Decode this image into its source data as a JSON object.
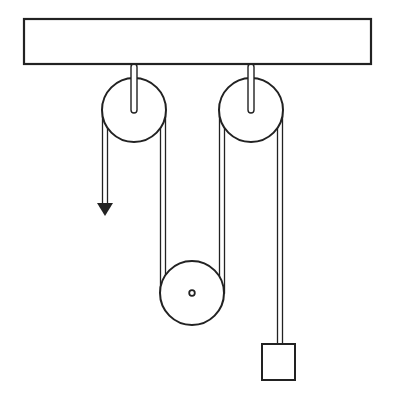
{
  "diagram": {
    "type": "pulley-system",
    "colors": {
      "stroke": "#222222",
      "fill": "#ffffff",
      "background": "#ffffff"
    },
    "beam": {
      "x": 24,
      "y": 19,
      "width": 347,
      "height": 45
    },
    "fixed_pulleys": [
      {
        "id": "left",
        "cx": 134,
        "cy": 110,
        "r": 32,
        "rod_top": 64
      },
      {
        "id": "right",
        "cx": 251,
        "cy": 110,
        "r": 32,
        "rod_top": 64
      }
    ],
    "movable_pulley": {
      "cx": 192,
      "cy": 293,
      "r": 32
    },
    "ropes": [
      {
        "id": "pull-end",
        "x": 105,
        "y1": 110,
        "y2": 205
      },
      {
        "id": "left-to-movable",
        "x": 163,
        "y1": 110,
        "y2": 293
      },
      {
        "id": "movable-to-right",
        "x": 222,
        "y1": 110,
        "y2": 293
      },
      {
        "id": "right-to-weight",
        "x": 280,
        "y1": 110,
        "y2": 344
      }
    ],
    "arrow": {
      "x": 105,
      "tip_y": 216,
      "direction": "down"
    },
    "weight": {
      "x": 262,
      "y": 344,
      "width": 33,
      "height": 36
    }
  }
}
